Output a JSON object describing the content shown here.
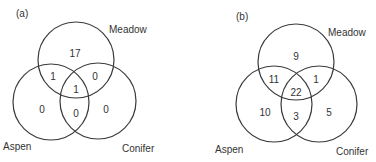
{
  "figure": {
    "panels": [
      {
        "id": "a",
        "label": "(a)",
        "sets": {
          "meadow": "Meadow",
          "aspen": "Aspen",
          "conifer": "Conifer"
        },
        "regions": {
          "meadow_only": "17",
          "aspen_only": "0",
          "conifer_only": "0",
          "meadow_aspen": "1",
          "meadow_conifer": "0",
          "aspen_conifer": "0",
          "all_three": "1"
        }
      },
      {
        "id": "b",
        "label": "(b)",
        "sets": {
          "meadow": "Meadow",
          "aspen": "Aspen",
          "conifer": "Conifer"
        },
        "regions": {
          "meadow_only": "9",
          "aspen_only": "10",
          "conifer_only": "5",
          "meadow_aspen": "11",
          "meadow_conifer": "1",
          "aspen_conifer": "3",
          "all_three": "22"
        }
      }
    ]
  },
  "colors": {
    "stroke": "#3a3a3a",
    "text": "#333333",
    "background": "#ffffff"
  }
}
